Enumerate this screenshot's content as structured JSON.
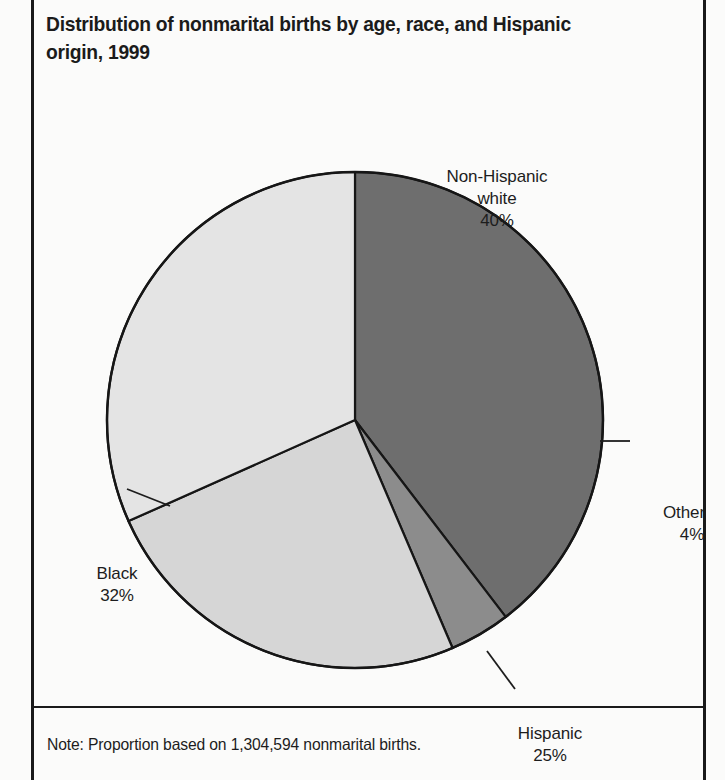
{
  "figure": {
    "title": "Distribution of nonmarital births by age, race, and Hispanic origin, 1999",
    "note": "Note: Proportion based on 1,304,594 nonmarital births."
  },
  "chart_data": {
    "type": "pie",
    "title": "Distribution of nonmarital births by age, race, and Hispanic origin, 1999",
    "note": "Note: Proportion based on 1,304,594 nonmarital births.",
    "total_births": "1,304,594",
    "xlabel": "",
    "ylabel": "",
    "legend_position": "none",
    "labels_position": "outside-with-leader-lines",
    "start_angle_deg": 0,
    "direction": "clockwise",
    "categories": [
      "Non-Hispanic white",
      "Black",
      "Hispanic",
      "Other"
    ],
    "values": [
      40,
      32,
      25,
      4
    ],
    "unit": "percent",
    "slices": [
      {
        "name": "Non-Hispanic white",
        "label_line1": "Non-Hispanic",
        "label_line2": "white",
        "value": 40,
        "value_label": "40%",
        "color": "#6e6e6e",
        "start_deg": 0,
        "end_deg": 144
      },
      {
        "name": "Other",
        "label_line1": "Other",
        "label_line2": "",
        "value": 4,
        "value_label": "4%",
        "color": "#8c8c8c",
        "start_deg": 144,
        "end_deg": 158.4
      },
      {
        "name": "Hispanic",
        "label_line1": "Hispanic",
        "label_line2": "",
        "value": 25,
        "value_label": "25%",
        "color": "#d6d6d6",
        "start_deg": 158.4,
        "end_deg": 248.4
      },
      {
        "name": "Black",
        "label_line1": "Black",
        "label_line2": "",
        "value": 32,
        "value_label": "32%",
        "color": "#e4e4e4",
        "start_deg": 248.4,
        "end_deg": 360
      }
    ]
  }
}
